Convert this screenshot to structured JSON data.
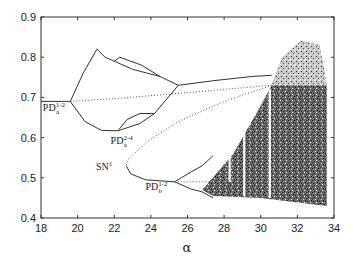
{
  "chart_data": {
    "type": "line",
    "title": "",
    "xlabel": "α",
    "ylabel": "",
    "xlim": [
      18,
      34
    ],
    "ylim": [
      0.4,
      0.9
    ],
    "xticks": [
      18,
      20,
      22,
      24,
      26,
      28,
      30,
      32,
      34
    ],
    "yticks": [
      0.4,
      0.5,
      0.6,
      0.7,
      0.8,
      0.9
    ],
    "grid": false,
    "legend": null,
    "annotations": [
      {
        "text": "PD",
        "sub": "a",
        "sup": "1-2",
        "x": 18.1,
        "y": 0.665
      },
      {
        "text": "PD",
        "sub": "a",
        "sup": "2-4",
        "x": 21.8,
        "y": 0.585
      },
      {
        "text": "SN",
        "sub": "",
        "sup": "1",
        "x": 21.0,
        "y": 0.52
      },
      {
        "text": "PD",
        "sub": "b",
        "sup": "1-2",
        "x": 23.7,
        "y": 0.47
      }
    ],
    "series": [
      {
        "name": "stable period-1 (left)",
        "style": "solid",
        "points": [
          [
            18,
            0.69
          ],
          [
            19.6,
            0.69
          ]
        ]
      },
      {
        "name": "period-2 upper branch",
        "style": "solid",
        "points": [
          [
            19.6,
            0.69
          ],
          [
            20.3,
            0.76
          ],
          [
            21.05,
            0.82
          ],
          [
            21.5,
            0.8
          ],
          [
            22.0,
            0.79
          ],
          [
            23.0,
            0.77
          ],
          [
            24.5,
            0.752
          ],
          [
            25.5,
            0.73
          ]
        ]
      },
      {
        "name": "period-4 bubble upper",
        "style": "solid",
        "points": [
          [
            22.0,
            0.79
          ],
          [
            22.3,
            0.8
          ],
          [
            23.5,
            0.78
          ],
          [
            24.5,
            0.752
          ]
        ]
      },
      {
        "name": "period-2 lower branch",
        "style": "solid",
        "points": [
          [
            19.6,
            0.69
          ],
          [
            20.4,
            0.64
          ],
          [
            21.3,
            0.618
          ],
          [
            22.2,
            0.617
          ],
          [
            23.4,
            0.635
          ],
          [
            24.2,
            0.66
          ],
          [
            25.5,
            0.73
          ]
        ]
      },
      {
        "name": "period-4 bubble lower",
        "style": "solid",
        "points": [
          [
            22.2,
            0.617
          ],
          [
            22.7,
            0.645
          ],
          [
            23.4,
            0.66
          ],
          [
            24.2,
            0.66
          ]
        ]
      },
      {
        "name": "large-amplitude upper branch",
        "style": "solid",
        "points": [
          [
            25.5,
            0.73
          ],
          [
            27.5,
            0.742
          ],
          [
            29.5,
            0.752
          ],
          [
            30.6,
            0.755
          ]
        ]
      },
      {
        "name": "unstable period-1",
        "style": "dotted",
        "points": [
          [
            19.6,
            0.69
          ],
          [
            22,
            0.697
          ],
          [
            25,
            0.708
          ],
          [
            28,
            0.72
          ],
          [
            30.6,
            0.73
          ]
        ]
      },
      {
        "name": "unstable SN branch",
        "style": "dotted",
        "points": [
          [
            30.6,
            0.73
          ],
          [
            28,
            0.69
          ],
          [
            25.5,
            0.64
          ],
          [
            23.8,
            0.59
          ],
          [
            22.8,
            0.548
          ],
          [
            22.65,
            0.53
          ]
        ]
      },
      {
        "name": "stable SN branch",
        "style": "solid",
        "points": [
          [
            22.65,
            0.53
          ],
          [
            22.9,
            0.51
          ],
          [
            23.7,
            0.495
          ],
          [
            25.3,
            0.49
          ]
        ]
      },
      {
        "name": "PD_b upper",
        "style": "solid",
        "points": [
          [
            25.3,
            0.49
          ],
          [
            26.2,
            0.515
          ],
          [
            26.8,
            0.53
          ],
          [
            27.4,
            0.555
          ]
        ]
      },
      {
        "name": "PD_b lower",
        "style": "solid",
        "points": [
          [
            25.3,
            0.49
          ],
          [
            26.2,
            0.472
          ],
          [
            26.8,
            0.465
          ],
          [
            27.4,
            0.45
          ]
        ]
      },
      {
        "name": "PD_b unstable",
        "style": "dotted",
        "points": [
          [
            25.3,
            0.49
          ],
          [
            27.4,
            0.49
          ]
        ]
      },
      {
        "name": "chaotic region",
        "style": "scatter-dense",
        "region_outline": [
          [
            26.8,
            0.47
          ],
          [
            28.5,
            0.56
          ],
          [
            30.0,
            0.68
          ],
          [
            30.6,
            0.73
          ],
          [
            31.2,
            0.8
          ],
          [
            32.2,
            0.84
          ],
          [
            33.2,
            0.83
          ],
          [
            33.6,
            0.73
          ],
          [
            33.6,
            0.43
          ],
          [
            30,
            0.45
          ],
          [
            27.4,
            0.455
          ]
        ]
      }
    ]
  }
}
